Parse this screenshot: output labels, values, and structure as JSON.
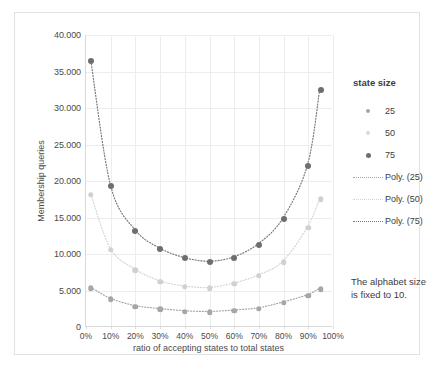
{
  "chart_data": {
    "type": "scatter",
    "title": "",
    "xlabel": "ratio of accepting states to total states",
    "ylabel": "Membership queries",
    "xlim": [
      0,
      100
    ],
    "ylim": [
      0,
      40000
    ],
    "grid": true,
    "legend_position": "right",
    "legend_title": "state size",
    "x_tick_labels": [
      "0%",
      "10%",
      "20%",
      "30%",
      "40%",
      "50%",
      "60%",
      "70%",
      "80%",
      "90%",
      "100%"
    ],
    "x_tick_values": [
      0,
      10,
      20,
      30,
      40,
      50,
      60,
      70,
      80,
      90,
      100
    ],
    "y_tick_labels": [
      "0",
      "5.000",
      "10.000",
      "15.000",
      "20.000",
      "25.000",
      "30.000",
      "35.000",
      "40.000"
    ],
    "y_tick_values": [
      0,
      5000,
      10000,
      15000,
      20000,
      25000,
      30000,
      35000,
      40000
    ],
    "x": [
      2,
      10,
      20,
      30,
      40,
      50,
      60,
      70,
      80,
      90,
      95
    ],
    "series": [
      {
        "name": "25",
        "color": "#a6a6a6",
        "values": [
          5300,
          3800,
          2800,
          2400,
          2100,
          2000,
          2200,
          2500,
          3300,
          4300,
          5200
        ]
      },
      {
        "name": "50",
        "color": "#d0d0d0",
        "values": [
          18100,
          10600,
          7800,
          6200,
          5500,
          5300,
          5900,
          7000,
          8900,
          13600,
          17500
        ]
      },
      {
        "name": "75",
        "color": "#6e6e6e",
        "values": [
          36400,
          19300,
          13200,
          10700,
          9400,
          8900,
          9500,
          11300,
          14800,
          22100,
          32500
        ]
      }
    ],
    "trendlines": [
      {
        "name": "Poly. (25)",
        "style": "dotted",
        "color": "#a6a6a6"
      },
      {
        "name": "Poly. (50)",
        "style": "dotted",
        "color": "#d4d4d4"
      },
      {
        "name": "Poly. (75)",
        "style": "dotted",
        "color": "#777777"
      }
    ],
    "annotation": "The alphabet size is fixed to 10."
  },
  "legend": {
    "title": "state size",
    "entries": [
      {
        "label": "25",
        "kind": "marker",
        "key": "k25"
      },
      {
        "label": "50",
        "kind": "marker",
        "key": "k50"
      },
      {
        "label": "75",
        "kind": "marker",
        "key": "k75"
      },
      {
        "label": "Poly. (25)",
        "kind": "line",
        "key": "l25"
      },
      {
        "label": "Poly. (50)",
        "kind": "line",
        "key": "l50"
      },
      {
        "label": "Poly. (75)",
        "kind": "line",
        "key": "l75"
      }
    ]
  },
  "axes": {
    "ylabel": "Membership queries",
    "xlabel": "ratio of accepting states to total states"
  },
  "annotation": {
    "text": "The alphabet size is fixed to 10."
  }
}
